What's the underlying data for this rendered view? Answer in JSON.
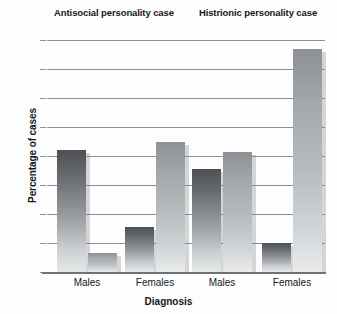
{
  "chart_data": {
    "type": "bar",
    "title": "",
    "xlabel": "Diagnosis",
    "ylabel": "Percentage of cases",
    "ylim": [
      0,
      80
    ],
    "yticks": [
      0,
      10,
      20,
      30,
      40,
      50,
      60,
      70,
      80
    ],
    "ytick_labels": [
      "0",
      "10",
      "20",
      "30",
      "40",
      "50",
      "60",
      "70",
      "80"
    ],
    "grid": true,
    "legend": "none",
    "group_titles": [
      "Antisocial personality case",
      "Histrionic personality case"
    ],
    "categories": [
      "Males",
      "Females",
      "Males",
      "Females"
    ],
    "series": [
      {
        "name": "dark",
        "values": [
          42,
          15.5,
          35.5,
          10
        ]
      },
      {
        "name": "light",
        "values": [
          6.5,
          45,
          41.5,
          77
        ]
      }
    ],
    "bars": [
      {
        "group": "Antisocial personality case",
        "category": "Males",
        "shade": "dark",
        "value": 42
      },
      {
        "group": "Antisocial personality case",
        "category": "Males",
        "shade": "light",
        "value": 6.5
      },
      {
        "group": "Antisocial personality case",
        "category": "Females",
        "shade": "dark",
        "value": 15.5
      },
      {
        "group": "Antisocial personality case",
        "category": "Females",
        "shade": "light",
        "value": 45
      },
      {
        "group": "Histrionic personality case",
        "category": "Males",
        "shade": "dark",
        "value": 35.5
      },
      {
        "group": "Histrionic personality case",
        "category": "Males",
        "shade": "light",
        "value": 41.5
      },
      {
        "group": "Histrionic personality case",
        "category": "Females",
        "shade": "dark",
        "value": 10
      },
      {
        "group": "Histrionic personality case",
        "category": "Females",
        "shade": "light",
        "value": 77
      }
    ],
    "colors": {
      "bar_dark_top": "#4d5054",
      "bar_dark_bottom": "#e6e8e9",
      "bar_light_top": "#8d9195",
      "bar_light_bottom": "#e9ebec",
      "gridline": "#8c9094",
      "axis": "#6e7276",
      "text": "#16181a",
      "background": "#fdfdfd"
    }
  },
  "titles": {
    "left_group": "Antisocial personality case",
    "right_group": "Histrionic personality case"
  },
  "axes": {
    "y_title": "Percentage of cases",
    "x_title": "Diagnosis"
  }
}
